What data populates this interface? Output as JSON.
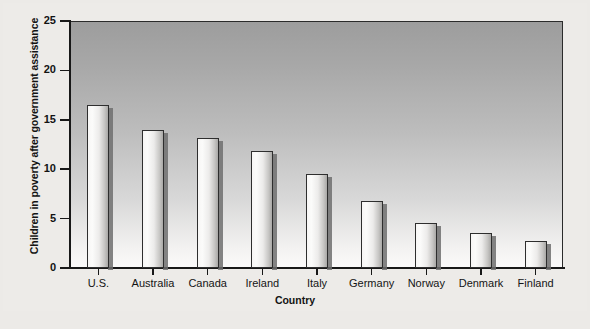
{
  "chart_data": {
    "type": "bar",
    "title": "",
    "xlabel": "Country",
    "ylabel": "Children in poverty after government assistance",
    "categories": [
      "U.S.",
      "Australia",
      "Canada",
      "Ireland",
      "Italy",
      "Germany",
      "Norway",
      "Denmark",
      "Finland"
    ],
    "values": [
      16.5,
      14.0,
      13.2,
      11.8,
      9.5,
      6.8,
      4.6,
      3.5,
      2.7
    ],
    "ylim": [
      0,
      25
    ],
    "yticks": [
      0,
      5,
      10,
      15,
      20,
      25
    ],
    "ytick_labels": [
      "0",
      "5",
      "10",
      "15",
      "20",
      "25"
    ],
    "grid": false,
    "legend": null,
    "series": [
      {
        "name": "Children in poverty after government assistance",
        "values": [
          16.5,
          14.0,
          13.2,
          11.8,
          9.5,
          6.8,
          4.6,
          3.5,
          2.7
        ]
      }
    ]
  },
  "figure": {
    "background_color": "#edebe8",
    "plot_top_color": "#9d9d9d",
    "plot_bottom_color": "#fbfafa",
    "axis_color": "#181818",
    "bar_face_color": "#f2f1f0",
    "bar_edge_color": "#2e2e2e"
  },
  "caption": ""
}
